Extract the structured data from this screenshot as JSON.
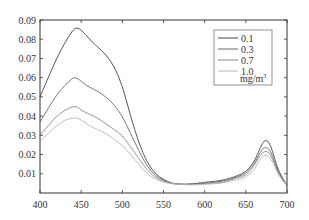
{
  "chart_data": {
    "type": "line",
    "title": "",
    "xlabel": "",
    "ylabel": "",
    "xlim": [
      400,
      700
    ],
    "ylim": [
      0,
      0.09
    ],
    "grid": false,
    "legend_position": "upper right (inside)",
    "x_ticks": [
      400,
      450,
      500,
      550,
      600,
      650,
      700
    ],
    "y_ticks": [
      0.01,
      0.02,
      0.03,
      0.04,
      0.05,
      0.06,
      0.07,
      0.08,
      0.09
    ],
    "x_tick_labels": [
      "400",
      "450",
      "500",
      "550",
      "600",
      "650",
      "700"
    ],
    "y_tick_labels": [
      "0.01",
      "0.02",
      "0.03",
      "0.04",
      "0.05",
      "0.06",
      "0.07",
      "0.08",
      "0.09"
    ],
    "legend_unit": "mg/m³",
    "x": [
      400,
      410,
      420,
      430,
      440,
      445,
      450,
      460,
      470,
      480,
      490,
      500,
      510,
      520,
      530,
      540,
      550,
      560,
      570,
      580,
      590,
      600,
      610,
      620,
      630,
      640,
      650,
      660,
      665,
      670,
      675,
      680,
      685,
      690,
      700
    ],
    "series": [
      {
        "name": "0.1",
        "color": "#444444",
        "values": [
          0.05,
          0.06,
          0.07,
          0.078,
          0.085,
          0.086,
          0.085,
          0.08,
          0.076,
          0.072,
          0.066,
          0.056,
          0.04,
          0.026,
          0.016,
          0.01,
          0.007,
          0.005,
          0.0045,
          0.0045,
          0.005,
          0.0055,
          0.006,
          0.0065,
          0.0075,
          0.009,
          0.011,
          0.016,
          0.021,
          0.026,
          0.028,
          0.025,
          0.018,
          0.011,
          0.004
        ]
      },
      {
        "name": "0.3",
        "color": "#6a6a6a",
        "values": [
          0.037,
          0.044,
          0.051,
          0.056,
          0.06,
          0.06,
          0.058,
          0.055,
          0.053,
          0.05,
          0.046,
          0.04,
          0.031,
          0.022,
          0.014,
          0.009,
          0.0065,
          0.005,
          0.0045,
          0.0045,
          0.005,
          0.005,
          0.0055,
          0.006,
          0.007,
          0.0085,
          0.01,
          0.015,
          0.019,
          0.023,
          0.024,
          0.022,
          0.016,
          0.01,
          0.004
        ]
      },
      {
        "name": "0.7",
        "color": "#8a8a8a",
        "values": [
          0.03,
          0.035,
          0.04,
          0.043,
          0.045,
          0.045,
          0.043,
          0.041,
          0.039,
          0.036,
          0.033,
          0.03,
          0.024,
          0.018,
          0.012,
          0.008,
          0.006,
          0.005,
          0.0045,
          0.0045,
          0.0045,
          0.005,
          0.005,
          0.0055,
          0.0065,
          0.008,
          0.009,
          0.014,
          0.018,
          0.021,
          0.022,
          0.02,
          0.015,
          0.009,
          0.004
        ]
      },
      {
        "name": "1.0",
        "color": "#b8b8b8",
        "values": [
          0.027,
          0.031,
          0.035,
          0.038,
          0.039,
          0.039,
          0.038,
          0.035,
          0.033,
          0.031,
          0.028,
          0.025,
          0.02,
          0.015,
          0.01,
          0.007,
          0.0055,
          0.0048,
          0.0045,
          0.0042,
          0.0042,
          0.0045,
          0.0048,
          0.005,
          0.006,
          0.007,
          0.008,
          0.012,
          0.016,
          0.019,
          0.02,
          0.018,
          0.014,
          0.009,
          0.004
        ]
      }
    ]
  },
  "legend": {
    "items": [
      {
        "label": "0.1",
        "color": "#444444"
      },
      {
        "label": "0.3",
        "color": "#6a6a6a"
      },
      {
        "label": "0.7",
        "color": "#8a8a8a"
      },
      {
        "label": "1.0",
        "color": "#b8b8b8"
      }
    ],
    "unit": "mg/m",
    "unit_superscript": "3"
  },
  "colors": {
    "axis": "#333333",
    "legend_border": "#777777"
  }
}
